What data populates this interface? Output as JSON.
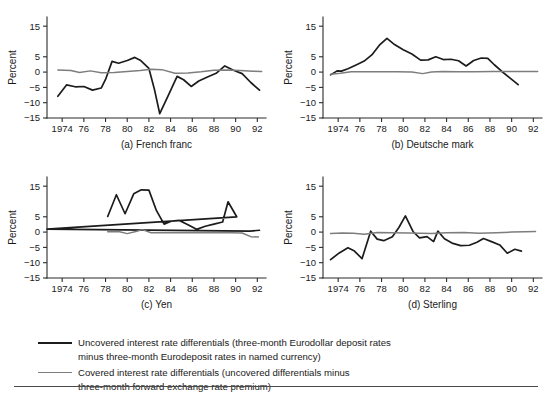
{
  "figure": {
    "axis_title_y": "Percent",
    "y_ticks": [
      "15",
      "5",
      "0",
      "-5",
      "-10",
      "-15"
    ],
    "y_tick_values": [
      15,
      5,
      0,
      -5,
      -10,
      -15
    ],
    "x_ticks": [
      "1974",
      "76",
      "78",
      "80",
      "82",
      "84",
      "86",
      "88",
      "90",
      "92"
    ],
    "x_tick_values": [
      1974,
      1976,
      1978,
      1980,
      1982,
      1984,
      1986,
      1988,
      1990,
      1992
    ],
    "colors": {
      "uncovered": "#1c1c1c",
      "covered": "#7d7d7d",
      "axis": "#2b2b2b",
      "text": "#1a1a1a",
      "background": "#ffffff"
    }
  },
  "legend": {
    "position": "bottom-left",
    "entries": [
      {
        "name": "uncovered-series",
        "swatch": "black-thick-line",
        "text": "Uncovered interest rate differentials (three-month Eurodollar deposit rates\nminus three-month Eurodeposit rates in named currency)"
      },
      {
        "name": "covered-series",
        "swatch": "gray-line",
        "text": "Covered interest rate differentials (uncovered differentials minus\nthree-month forward exchange rate premium)"
      }
    ]
  },
  "chart_data": [
    {
      "type": "line",
      "panel": "a",
      "title": "(a) French franc",
      "xlabel": "",
      "ylabel": "Percent",
      "xlim": [
        1972.6,
        1992.8
      ],
      "ylim": [
        -15,
        18
      ],
      "grid": false,
      "legend_position": "external-bottom",
      "series": [
        {
          "name": "Uncovered interest rate differentials",
          "color": "#1c1c1c",
          "x": [
            1973.6,
            1974.4,
            1975.2,
            1976.0,
            1976.8,
            1977.6,
            1978.0,
            1978.6,
            1979.2,
            1980.0,
            1980.7,
            1981.2,
            1982.0,
            1982.5,
            1983.0,
            1983.8,
            1984.6,
            1985.2,
            1985.9,
            1986.6,
            1987.4,
            1988.2,
            1989.0,
            1989.8,
            1990.6,
            1991.4,
            1992.2
          ],
          "values": [
            -7.9,
            -4.2,
            -4.8,
            -4.7,
            -5.9,
            -5.2,
            -2.4,
            3.5,
            2.9,
            3.8,
            4.8,
            3.9,
            1.2,
            -5.5,
            -13.6,
            -7.5,
            -1.4,
            -2.5,
            -4.7,
            -2.9,
            -1.6,
            -0.4,
            2.0,
            0.6,
            -0.5,
            -3.4,
            -5.9
          ]
        },
        {
          "name": "Covered interest rate differentials",
          "color": "#7d7d7d",
          "x": [
            1973.6,
            1974.8,
            1975.6,
            1976.6,
            1977.6,
            1978.8,
            1980.0,
            1981.2,
            1982.2,
            1983.2,
            1984.4,
            1985.6,
            1986.8,
            1988.0,
            1989.2,
            1990.4,
            1991.6,
            1992.4
          ],
          "values": [
            0.7,
            0.5,
            -0.1,
            0.4,
            -0.2,
            -0.1,
            0.2,
            0.5,
            0.9,
            0.8,
            -0.4,
            -0.3,
            0.1,
            0.6,
            0.7,
            0.5,
            0.3,
            0.2
          ]
        }
      ]
    },
    {
      "type": "line",
      "panel": "b",
      "title": "(b) Deutsche mark",
      "xlabel": "",
      "ylabel": "Percent",
      "xlim": [
        1972.6,
        1992.8
      ],
      "ylim": [
        -15,
        18
      ],
      "grid": false,
      "legend_position": "external-bottom",
      "series": [
        {
          "name": "Uncovered interest rate differentials",
          "color": "#1c1c1c",
          "x": [
            1973.3,
            1973.9,
            1974.3,
            1974.9,
            1975.7,
            1976.4,
            1977.1,
            1977.8,
            1978.5,
            1979.2,
            1980.0,
            1980.8,
            1981.6,
            1982.3,
            1983.0,
            1983.7,
            1984.4,
            1985.1,
            1985.8,
            1986.5,
            1987.2,
            1987.8,
            1988.4,
            1989.1,
            1989.8,
            1990.6
          ],
          "values": [
            -0.9,
            0.4,
            0.3,
            1.1,
            2.4,
            3.6,
            5.6,
            8.8,
            11.0,
            9.0,
            7.3,
            5.9,
            3.9,
            4.0,
            5.0,
            4.1,
            4.2,
            3.7,
            2.0,
            3.8,
            4.6,
            4.5,
            2.4,
            0.2,
            -1.8,
            -4.1
          ]
        },
        {
          "name": "Covered interest rate differentials",
          "color": "#7d7d7d",
          "x": [
            1973.3,
            1974.2,
            1975.2,
            1976.6,
            1978.0,
            1979.4,
            1980.8,
            1981.8,
            1982.6,
            1983.6,
            1985.0,
            1986.6,
            1988.2,
            1989.6,
            1990.8,
            1992.4
          ],
          "values": [
            -0.7,
            -0.4,
            0.1,
            0.1,
            0.1,
            0.1,
            0.0,
            -0.5,
            0.0,
            0.2,
            0.1,
            0.1,
            0.2,
            0.2,
            0.2,
            0.2
          ]
        }
      ]
    },
    {
      "type": "line",
      "panel": "c",
      "title": "(c) Yen",
      "xlabel": "",
      "ylabel": "Percent",
      "xlim": [
        1972.6,
        1992.8
      ],
      "ylim": [
        -15,
        18
      ],
      "grid": false,
      "legend_position": "external-bottom",
      "series": [
        {
          "name": "Uncovered interest rate differentials",
          "color": "#1c1c1c",
          "x": [
            1978.2,
            1979.0,
            1979.8,
            1980.6,
            1981.3,
            1982.0,
            1982.7,
            1983.4,
            1984.1,
            1984.8,
            1985.6,
            1986.4,
            1987.2,
            1988.0,
            1988.8,
            1989.3,
            1990.1,
            1090.9,
            1991.3,
            1992.2
          ],
          "values": [
            5.1,
            12.2,
            6.0,
            12.5,
            13.8,
            13.7,
            7.0,
            2.6,
            3.6,
            3.8,
            2.4,
            0.9,
            1.9,
            2.6,
            3.3,
            9.9,
            5.0,
            1.0,
            0.3,
            0.6
          ]
        },
        {
          "name": "Covered interest rate differentials",
          "color": "#7d7d7d",
          "x": [
            1978.2,
            1979.2,
            1980.0,
            1980.8,
            1981.4,
            1982.2,
            1983.4,
            1985.0,
            1986.6,
            1988.2,
            1989.6,
            1990.6,
            1991.4,
            1992.1
          ],
          "values": [
            0.1,
            0.2,
            -0.5,
            0.2,
            0.8,
            -0.2,
            -0.2,
            -0.2,
            -0.2,
            -0.2,
            -0.2,
            -0.3,
            -1.5,
            -1.6
          ]
        }
      ]
    },
    {
      "type": "line",
      "panel": "d",
      "title": "(d) Sterling",
      "xlabel": "",
      "ylabel": "Percent",
      "xlim": [
        1972.6,
        1992.8
      ],
      "ylim": [
        -15,
        18
      ],
      "grid": false,
      "legend_position": "external-bottom",
      "series": [
        {
          "name": "Uncovered interest rate differentials",
          "color": "#1c1c1c",
          "x": [
            1973.3,
            1974.1,
            1974.9,
            1975.5,
            1976.2,
            1977.0,
            1977.6,
            1978.2,
            1979.0,
            1979.6,
            1980.2,
            1980.9,
            1981.5,
            1982.2,
            1982.8,
            1983.2,
            1983.8,
            1984.5,
            1985.3,
            1986.1,
            1986.8,
            1987.4,
            1988.2,
            1988.9,
            1989.6,
            1990.3,
            1990.9
          ],
          "values": [
            -9.0,
            -6.8,
            -5.1,
            -6.2,
            -8.7,
            0.3,
            -2.3,
            -2.8,
            -1.5,
            1.5,
            5.3,
            0.2,
            -1.9,
            -1.5,
            -3.1,
            0.3,
            -2.2,
            -3.6,
            -4.4,
            -4.3,
            -3.3,
            -2.1,
            -3.2,
            -4.2,
            -6.9,
            -5.6,
            -6.2
          ]
        },
        {
          "name": "Covered interest rate differentials",
          "color": "#7d7d7d",
          "x": [
            1973.3,
            1974.4,
            1975.4,
            1976.4,
            1977.6,
            1979.0,
            1980.4,
            1981.6,
            1982.6,
            1984.0,
            1985.6,
            1987.0,
            1988.6,
            1990.0,
            1991.2,
            1992.2
          ],
          "values": [
            -0.5,
            -0.3,
            -0.4,
            -0.7,
            -0.1,
            -0.2,
            -0.3,
            -0.4,
            -0.5,
            -0.2,
            -0.1,
            -0.4,
            -0.2,
            0.0,
            0.1,
            0.2
          ]
        }
      ]
    }
  ]
}
